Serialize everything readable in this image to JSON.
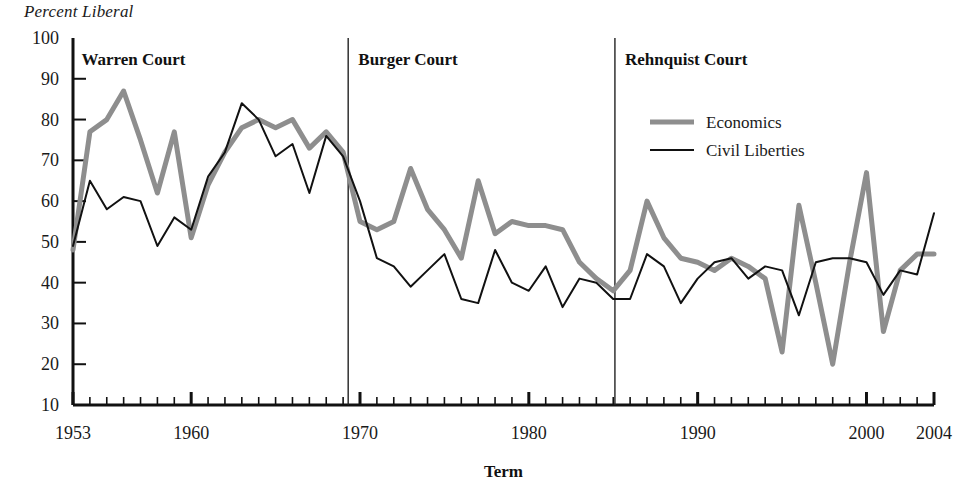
{
  "chart_data": {
    "type": "line",
    "title": "",
    "ylabel": "Percent Liberal",
    "xlabel": "Term",
    "ylim": [
      10,
      100
    ],
    "ytick_step": 10,
    "yticks": [
      10,
      20,
      30,
      40,
      50,
      60,
      70,
      80,
      90,
      100
    ],
    "xlim": [
      1953,
      2004
    ],
    "xticks_labeled": [
      1953,
      1960,
      1970,
      1980,
      1990,
      2000,
      2004
    ],
    "xtick_minor_step": 1,
    "grid": false,
    "legend_position": "upper-right",
    "x": [
      1953,
      1954,
      1955,
      1956,
      1957,
      1958,
      1959,
      1960,
      1961,
      1962,
      1963,
      1964,
      1965,
      1966,
      1967,
      1968,
      1969,
      1970,
      1971,
      1972,
      1973,
      1974,
      1975,
      1976,
      1977,
      1978,
      1979,
      1980,
      1981,
      1982,
      1983,
      1984,
      1985,
      1986,
      1987,
      1988,
      1989,
      1990,
      1991,
      1992,
      1993,
      1994,
      1995,
      1996,
      1997,
      1998,
      1999,
      2000,
      2001,
      2002,
      2003,
      2004
    ],
    "series": [
      {
        "name": "Economics",
        "color": "#8e8e8e",
        "width": 5,
        "values": [
          48,
          77,
          80,
          87,
          75,
          62,
          77,
          51,
          64,
          72,
          78,
          80,
          78,
          80,
          73,
          77,
          72,
          55,
          53,
          55,
          68,
          58,
          53,
          46,
          65,
          52,
          55,
          54,
          54,
          53,
          45,
          41,
          38,
          43,
          60,
          51,
          46,
          45,
          43,
          46,
          44,
          41,
          23,
          59,
          40,
          20,
          45,
          67,
          28,
          43,
          47,
          47
        ]
      },
      {
        "name": "Civil Liberties",
        "color": "#111111",
        "width": 2,
        "values": [
          49,
          65,
          58,
          61,
          60,
          49,
          56,
          53,
          66,
          72,
          84,
          80,
          71,
          74,
          62,
          76,
          71,
          60,
          46,
          44,
          39,
          43,
          47,
          36,
          35,
          48,
          40,
          38,
          44,
          34,
          41,
          40,
          36,
          36,
          47,
          44,
          35,
          41,
          45,
          46,
          41,
          44,
          43,
          32,
          45,
          46,
          46,
          45,
          37,
          43,
          42,
          57
        ]
      }
    ],
    "annotations": [
      {
        "label": "Warren Court",
        "divider_x": 1969.3,
        "text_x": 1953.5
      },
      {
        "label": "Burger Court",
        "divider_x": 1985.1,
        "text_x": 1969.9
      },
      {
        "label": "Rehnquist Court",
        "divider_x": null,
        "text_x": 1985.7
      }
    ]
  },
  "legend": {
    "items": [
      {
        "label": "Economics"
      },
      {
        "label": "Civil Liberties"
      }
    ]
  }
}
